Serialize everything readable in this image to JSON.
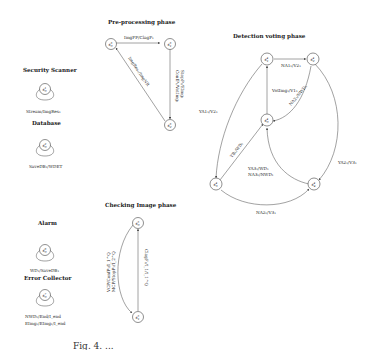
{
  "figure": {
    "caption_fragment": "Fig. 4. ..."
  },
  "components": {
    "security_scanner": {
      "title": "Security Scanner",
      "state": "s",
      "sup": "1",
      "sub": "0",
      "loop_label": "Stream/ImgRes₁"
    },
    "database": {
      "title": "Database",
      "state": "s",
      "sup": "2",
      "sub": "0",
      "loop_label": "SaveDB₁/WDET"
    },
    "alarm": {
      "title": "Alarm",
      "state": "s",
      "sup": "6",
      "sub": "0",
      "loop_label": "WD₁/SaveDB₁"
    },
    "error_collector": {
      "title": "Error Collector",
      "state": "s",
      "sup": "7",
      "sub": "0",
      "loop_label_1": "NWD₁/End/I_end",
      "loop_label_2": "EImg₁/EImg₁/I_end"
    }
  },
  "phases": {
    "preprocessing": {
      "title": "Pre-processing phase",
      "nodes": [
        {
          "id": "s3_0",
          "label": "s",
          "sup": "3",
          "sub": "0"
        },
        {
          "id": "s3_1",
          "label": "s",
          "sup": "3",
          "sub": "1"
        },
        {
          "id": "s3_2",
          "label": "s",
          "sup": "3",
          "sub": "2"
        }
      ],
      "edges": [
        {
          "from": "s3_0",
          "to": "s3_1",
          "label": "ImgFP/ClagF₁"
        },
        {
          "from": "s3_1",
          "to": "s3_2",
          "label_1": "ConfP₁/VotImg₁",
          "label_2": "StopP₁/EImg₁"
        },
        {
          "from": "s3_2",
          "to": "s3_0",
          "label": "ImgRes₁/ImgNR"
        }
      ]
    },
    "checking_image": {
      "title": "Checking Image phase",
      "nodes": [
        {
          "id": "s5_0",
          "label": "s",
          "sup": "5",
          "sub": "0"
        },
        {
          "id": "s5_1",
          "label": "s",
          "sup": "5",
          "sub": "1"
        }
      ],
      "edges": [
        {
          "from": "s5_0",
          "to": "s5_1",
          "label_1": "VCP/ConfP₁/I_1^Q",
          "label_2": "MCP/StopP₁/I_2^Q"
        },
        {
          "from": "s5_1",
          "to": "s5_0",
          "label": "ClagF₁/I_1/I_1^Q"
        }
      ]
    },
    "detection_voting": {
      "title": "Detection voting phase",
      "nodes": [
        {
          "id": "s4_0",
          "label": "s",
          "sup": "4",
          "sub": "0"
        },
        {
          "id": "s4_1",
          "label": "s",
          "sup": "4",
          "sub": "1"
        },
        {
          "id": "s4_2",
          "label": "s",
          "sup": "4",
          "sub": "2"
        },
        {
          "id": "s4_3",
          "label": "s",
          "sup": "4",
          "sub": "3"
        },
        {
          "id": "s4_4",
          "label": "s",
          "sup": "4",
          "sub": "4"
        }
      ],
      "edges": [
        {
          "from": "s4_1",
          "to": "s4_2",
          "label": "NA1₁/V2₁"
        },
        {
          "from": "s4_0",
          "to": "s4_1",
          "label": "VotImg₁/V1₁"
        },
        {
          "from": "s4_2",
          "to": "s4_0",
          "label": "NA2₁/NWD₁"
        },
        {
          "from": "s4_1",
          "to": "s4_3",
          "label": "YA1₁/V2₁"
        },
        {
          "from": "s4_3",
          "to": "s4_0",
          "label": "YB₁/WD₁"
        },
        {
          "from": "s4_2",
          "to": "s4_4",
          "label": "YA2₁/V3₁"
        },
        {
          "from": "s4_4",
          "to": "s4_0",
          "label_1": "YA3₁/WD₁",
          "label_2": "NA3₁/NWD₁"
        },
        {
          "from": "s4_3",
          "to": "s4_4",
          "label": "NA2₁/V3₁"
        }
      ]
    }
  }
}
